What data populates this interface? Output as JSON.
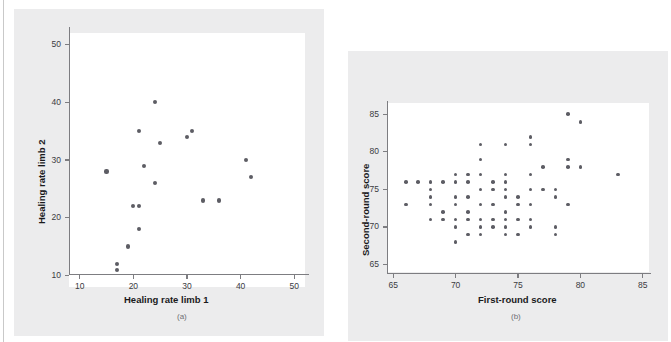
{
  "figure": {
    "background_color": "#ececed",
    "plot_background_color": "#ffffff",
    "axis_color": "#7d7d81",
    "marker_color": "#5d5d64"
  },
  "panels": [
    {
      "id": "a",
      "caption": "(a)",
      "xlabel": "Healing rate limb 1",
      "ylabel": "Healing rate limb 2"
    },
    {
      "id": "b",
      "caption": "(b)",
      "xlabel": "First-round score",
      "ylabel": "Second-round score"
    }
  ],
  "chart_data": [
    {
      "type": "scatter",
      "panel": "(a)",
      "title": "",
      "xlabel": "Healing rate limb 1",
      "ylabel": "Healing rate limb 2",
      "xlim": [
        8,
        52
      ],
      "ylim": [
        8,
        52
      ],
      "xticks": [
        10,
        20,
        30,
        40,
        50
      ],
      "yticks": [
        10,
        20,
        30,
        40,
        50
      ],
      "xticklabels": [
        "10",
        "20",
        "30",
        "40",
        "50"
      ],
      "yticklabels": [
        "10",
        "20",
        "30",
        "40",
        "50"
      ],
      "grid": false,
      "legend": "none",
      "n_points": 19,
      "points": [
        {
          "x": 15,
          "y": 28
        },
        {
          "x": 17,
          "y": 12
        },
        {
          "x": 17,
          "y": 11
        },
        {
          "x": 19,
          "y": 15
        },
        {
          "x": 20,
          "y": 22
        },
        {
          "x": 21,
          "y": 22
        },
        {
          "x": 21,
          "y": 18
        },
        {
          "x": 21,
          "y": 35
        },
        {
          "x": 22,
          "y": 29
        },
        {
          "x": 24,
          "y": 40
        },
        {
          "x": 24,
          "y": 26
        },
        {
          "x": 25,
          "y": 33
        },
        {
          "x": 30,
          "y": 34
        },
        {
          "x": 31,
          "y": 35
        },
        {
          "x": 33,
          "y": 23
        },
        {
          "x": 36,
          "y": 23
        },
        {
          "x": 41,
          "y": 30
        },
        {
          "x": 42,
          "y": 27
        }
      ]
    },
    {
      "type": "scatter",
      "panel": "(b)",
      "title": "",
      "xlabel": "First-round score",
      "ylabel": "Second-round score",
      "xlim": [
        64.5,
        85.5
      ],
      "ylim": [
        64,
        86.5
      ],
      "xticks": [
        65,
        70,
        75,
        80,
        85
      ],
      "yticks": [
        65,
        70,
        75,
        80,
        85
      ],
      "xticklabels": [
        "65",
        "70",
        "75",
        "80",
        "85"
      ],
      "yticklabels": [
        "65",
        "70",
        "75",
        "80",
        "85"
      ],
      "grid": false,
      "legend": "none",
      "n_points": 76,
      "points": [
        {
          "x": 66,
          "y": 76
        },
        {
          "x": 66,
          "y": 73
        },
        {
          "x": 67,
          "y": 76
        },
        {
          "x": 68,
          "y": 76
        },
        {
          "x": 68,
          "y": 75
        },
        {
          "x": 68,
          "y": 74
        },
        {
          "x": 68,
          "y": 73
        },
        {
          "x": 68,
          "y": 71
        },
        {
          "x": 69,
          "y": 76
        },
        {
          "x": 69,
          "y": 72
        },
        {
          "x": 69,
          "y": 71
        },
        {
          "x": 70,
          "y": 77
        },
        {
          "x": 70,
          "y": 76
        },
        {
          "x": 70,
          "y": 74
        },
        {
          "x": 70,
          "y": 73
        },
        {
          "x": 70,
          "y": 71
        },
        {
          "x": 70,
          "y": 70
        },
        {
          "x": 70,
          "y": 68
        },
        {
          "x": 71,
          "y": 77
        },
        {
          "x": 71,
          "y": 76
        },
        {
          "x": 71,
          "y": 74
        },
        {
          "x": 71,
          "y": 72
        },
        {
          "x": 71,
          "y": 71
        },
        {
          "x": 71,
          "y": 69
        },
        {
          "x": 72,
          "y": 81
        },
        {
          "x": 72,
          "y": 79
        },
        {
          "x": 72,
          "y": 77
        },
        {
          "x": 72,
          "y": 75
        },
        {
          "x": 72,
          "y": 73
        },
        {
          "x": 72,
          "y": 71
        },
        {
          "x": 72,
          "y": 70
        },
        {
          "x": 72,
          "y": 69
        },
        {
          "x": 73,
          "y": 76
        },
        {
          "x": 73,
          "y": 75
        },
        {
          "x": 73,
          "y": 73
        },
        {
          "x": 73,
          "y": 71
        },
        {
          "x": 73,
          "y": 70
        },
        {
          "x": 74,
          "y": 81
        },
        {
          "x": 74,
          "y": 77
        },
        {
          "x": 74,
          "y": 76
        },
        {
          "x": 74,
          "y": 75
        },
        {
          "x": 74,
          "y": 74
        },
        {
          "x": 74,
          "y": 72
        },
        {
          "x": 74,
          "y": 71
        },
        {
          "x": 74,
          "y": 70
        },
        {
          "x": 74,
          "y": 69
        },
        {
          "x": 75,
          "y": 74
        },
        {
          "x": 75,
          "y": 73
        },
        {
          "x": 75,
          "y": 71
        },
        {
          "x": 75,
          "y": 69
        },
        {
          "x": 76,
          "y": 82
        },
        {
          "x": 76,
          "y": 81
        },
        {
          "x": 76,
          "y": 77
        },
        {
          "x": 76,
          "y": 75
        },
        {
          "x": 76,
          "y": 73
        },
        {
          "x": 76,
          "y": 71
        },
        {
          "x": 76,
          "y": 70
        },
        {
          "x": 77,
          "y": 78
        },
        {
          "x": 77,
          "y": 75
        },
        {
          "x": 78,
          "y": 75
        },
        {
          "x": 78,
          "y": 74
        },
        {
          "x": 78,
          "y": 70
        },
        {
          "x": 78,
          "y": 69
        },
        {
          "x": 79,
          "y": 85
        },
        {
          "x": 79,
          "y": 79
        },
        {
          "x": 79,
          "y": 78
        },
        {
          "x": 79,
          "y": 73
        },
        {
          "x": 80,
          "y": 84
        },
        {
          "x": 80,
          "y": 78
        },
        {
          "x": 83,
          "y": 77
        }
      ]
    }
  ]
}
